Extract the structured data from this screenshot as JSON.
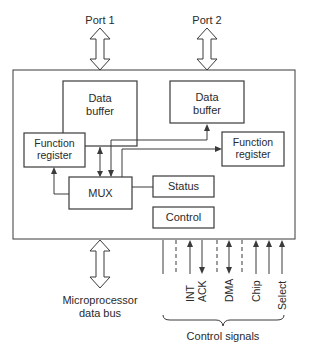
{
  "ports": {
    "port1": "Port 1",
    "port2": "Port 2"
  },
  "blocks": {
    "data_buffer_left": [
      "Data",
      "buffer"
    ],
    "data_buffer_right": [
      "Data",
      "buffer"
    ],
    "function_register_left": [
      "Function",
      "register"
    ],
    "function_register_right": [
      "Function",
      "register"
    ],
    "mux": "MUX",
    "status": "Status",
    "control": "Control"
  },
  "bus": {
    "label": [
      "Microprocessor",
      "data bus"
    ]
  },
  "control_signals": {
    "labels": [
      "INT",
      "ACK",
      "DMA",
      "Chip",
      "Select"
    ],
    "group_label": "Control signals"
  },
  "colors": {
    "line": "#3a3a3a",
    "text": "#2a2a2a",
    "background": "#ffffff"
  }
}
